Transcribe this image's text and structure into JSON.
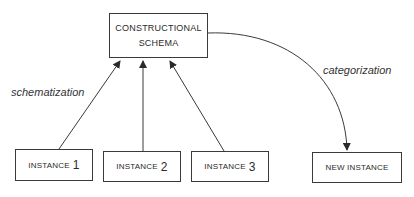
{
  "diagram": {
    "schema": {
      "line1": "CONSTRUCTIONAL",
      "line2": "SCHEMA"
    },
    "instances": [
      {
        "label": "INSTANCE",
        "num": "1"
      },
      {
        "label": "INSTANCE",
        "num": "2"
      },
      {
        "label": "INSTANCE",
        "num": "3"
      }
    ],
    "new_instance": {
      "label": "NEW INSTANCE"
    },
    "edges": {
      "schematization": "schematization",
      "categorization": "categorization"
    },
    "colors": {
      "line": "#3a3a3a",
      "text": "#2a2a2a",
      "background": "#ffffff"
    }
  }
}
